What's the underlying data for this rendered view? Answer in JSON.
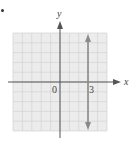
{
  "chart_data": {
    "type": "line",
    "title": "",
    "xlabel": "x",
    "ylabel": "y",
    "xlim": [
      -5,
      5
    ],
    "ylim": [
      -5,
      5
    ],
    "grid": true,
    "tick_labels": [
      {
        "label": "0",
        "x": 0,
        "y": 0
      },
      {
        "label": "3",
        "x": 3,
        "y": 0
      }
    ],
    "series": [
      {
        "name": "x = 3",
        "kind": "vertical-line",
        "x": [
          3,
          3
        ],
        "y": [
          -5,
          5
        ],
        "arrows": "both",
        "color": "#8a8a8a"
      }
    ]
  },
  "labels": {
    "x_axis": "x",
    "y_axis": "y",
    "origin": "0",
    "tick_3": "3"
  },
  "colors": {
    "grid_bg": "#ececec",
    "grid_line": "#d2d2d2",
    "axis": "#555555",
    "line": "#8a8a8a"
  }
}
